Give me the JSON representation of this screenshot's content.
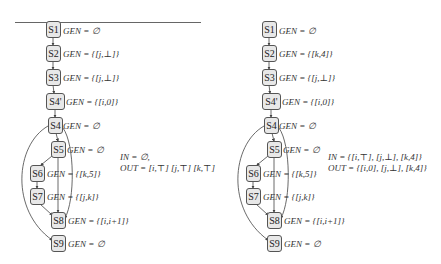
{
  "diagrams": [
    {
      "id": "left",
      "nodes": [
        {
          "label": "S1",
          "gen": "GEN = ∅"
        },
        {
          "label": "S2",
          "gen": "GEN = {[k,4]}"
        },
        {
          "label": "S3",
          "gen": "GEN = {[j,⊥]}"
        },
        {
          "label": "S4'",
          "gen": "GEN = {[i,0]}"
        },
        {
          "label": "S4",
          "gen": "GEN = ∅"
        },
        {
          "label": "S5",
          "gen": "GEN = ∅"
        },
        {
          "label": "S6",
          "gen": "GEN = {[k,5]}"
        },
        {
          "label": "S7",
          "gen": "GEN = {[j,k]}"
        },
        {
          "label": "S8",
          "gen": "GEN = {[i,i+1]}"
        },
        {
          "label": "S9",
          "gen": "GEN = ∅"
        }
      ],
      "in_label": "IN = ∅,",
      "out_label": "OUT = [i,⊤] [j,⊤] [k,⊤]"
    },
    {
      "id": "right",
      "nodes": [
        {
          "label": "S1",
          "gen": "GEN = ∅"
        },
        {
          "label": "S2",
          "gen": "GEN = {[k,4]}"
        },
        {
          "label": "S3",
          "gen": "GEN = {[j,⊥]}"
        },
        {
          "label": "S4'",
          "gen": "GEN = {[i,0]}"
        },
        {
          "label": "S4",
          "gen": "GEN = ∅"
        },
        {
          "label": "S5",
          "gen": "GEN = ∅"
        },
        {
          "label": "S6",
          "gen": "GEN = {[k,5]}"
        },
        {
          "label": "S7",
          "gen": "GEN = {[j,k]}"
        },
        {
          "label": "S8",
          "gen": "GEN = {[i,i+1]}"
        },
        {
          "label": "S9",
          "gen": "GEN = ∅"
        }
      ],
      "in_label": "IN = {[i,⊤], [j,⊥], [k,4]}",
      "out_label": "OUT = {[i,0], [j,⊥], [k,4]}"
    }
  ]
}
